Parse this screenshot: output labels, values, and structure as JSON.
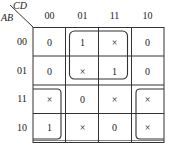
{
  "kmap": {
    "row_var": "AB",
    "col_var": "CD",
    "col_labels": [
      "00",
      "01",
      "11",
      "10"
    ],
    "row_labels": [
      "00",
      "01",
      "11",
      "10"
    ],
    "cells": [
      [
        "0",
        "1",
        "×",
        "0"
      ],
      [
        "0",
        "×",
        "1",
        "0"
      ],
      [
        "×",
        "0",
        "×",
        "×"
      ],
      [
        "1",
        "×",
        "0",
        "×"
      ]
    ],
    "groups": [
      {
        "name": "center-top-group",
        "rows": [
          0,
          1
        ],
        "cols": [
          1,
          2
        ]
      },
      {
        "name": "corner-wrap-group",
        "rows": [
          2,
          3
        ],
        "cols": [
          0,
          3
        ]
      }
    ],
    "line_color": "#333333"
  }
}
